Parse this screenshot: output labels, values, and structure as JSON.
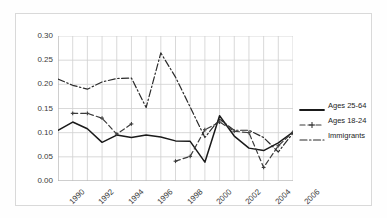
{
  "chart_data": {
    "type": "line",
    "title": "",
    "xlabel": "",
    "ylabel": "",
    "xlim": [
      1990,
      2006
    ],
    "ylim": [
      0.0,
      0.3
    ],
    "ytick_step": 0.05,
    "xtick_step": 1,
    "xtick_label_step": 2,
    "grid": true,
    "legend_position": "right",
    "yticks": [
      "0.00",
      "0.05",
      "0.10",
      "0.15",
      "0.20",
      "0.25",
      "0.30"
    ],
    "xticks": [
      "1990",
      "1992",
      "1994",
      "1996",
      "1998",
      "2000",
      "2002",
      "2004",
      "2006"
    ],
    "x": [
      1990,
      1991,
      1992,
      1993,
      1994,
      1995,
      1996,
      1997,
      1998,
      1999,
      2000,
      2001,
      2002,
      2003,
      2004,
      2005,
      2006
    ],
    "series": [
      {
        "name": "Ages 25-64",
        "color": "#1a1a1a",
        "style": "solid",
        "marker": "none",
        "values": [
          0.105,
          0.122,
          0.108,
          0.08,
          0.095,
          0.09,
          0.095,
          0.091,
          0.083,
          0.082,
          0.039,
          0.135,
          0.093,
          0.068,
          0.063,
          0.079,
          0.101
        ]
      },
      {
        "name": "Ages 18-24",
        "color": "#3c3c3c",
        "style": "dashed",
        "marker": "cross",
        "values": [
          null,
          0.14,
          0.14,
          0.13,
          0.097,
          0.118,
          null,
          null,
          0.041,
          0.051,
          0.106,
          0.122,
          0.103,
          0.1,
          0.028,
          0.073,
          0.101
        ]
      },
      {
        "name": "Immigrants",
        "color": "#2b2b2b",
        "style": "dashdot",
        "marker": "none",
        "values": [
          0.211,
          0.198,
          0.19,
          0.205,
          0.212,
          0.213,
          0.152,
          0.265,
          0.215,
          0.153,
          0.09,
          0.128,
          0.105,
          0.105,
          0.09,
          0.06,
          0.099
        ]
      }
    ]
  },
  "legend": {
    "entries": [
      {
        "label": "Ages 25-64",
        "key": "solid-line-key"
      },
      {
        "label": "Ages 18-24",
        "key": "dashed-cross-line-key"
      },
      {
        "label": "Immigrants",
        "key": "dashdot-line-key"
      }
    ]
  }
}
